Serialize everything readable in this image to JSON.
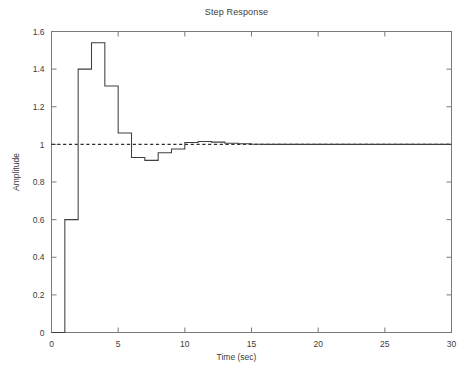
{
  "chart_data": {
    "type": "line",
    "title": "Step Response",
    "xlabel": "Time (sec)",
    "ylabel": "Amplitude",
    "xlim": [
      0,
      30
    ],
    "ylim": [
      0,
      1.6
    ],
    "xticks": [
      0,
      5,
      10,
      15,
      20,
      25,
      30
    ],
    "yticks": [
      0,
      0.2,
      0.4,
      0.6,
      0.8,
      1,
      1.2,
      1.4,
      1.6
    ],
    "xtick_labels": [
      "0",
      "5",
      "10",
      "15",
      "20",
      "25",
      "30"
    ],
    "ytick_labels": [
      "0",
      "0.2",
      "0.4",
      "0.6",
      "0.8",
      "1",
      "1.2",
      "1.4",
      "1.6"
    ],
    "grid": false,
    "legend": "none",
    "drawstyle": "steps-post",
    "series": [
      {
        "name": "step-response",
        "style": "solid",
        "color": "#3f3f3f",
        "x": [
          0,
          1,
          2,
          3,
          4,
          5,
          6,
          7,
          8,
          9,
          10,
          11,
          12,
          13,
          14,
          15,
          16,
          17,
          18,
          19,
          20,
          21,
          22,
          23,
          24,
          25,
          26,
          27,
          28,
          29,
          30
        ],
        "values": [
          0,
          0.6,
          1.4,
          1.54,
          1.31,
          1.06,
          0.93,
          0.915,
          0.955,
          0.975,
          1.01,
          1.015,
          1.012,
          1.006,
          1.003,
          1.001,
          1.0,
          1.0,
          1.0,
          1.0,
          1.0,
          1.0,
          1.0,
          1.0,
          1.0,
          1.0,
          1.0,
          1.0,
          1.0,
          1.0,
          1.0
        ]
      },
      {
        "name": "steady-state-reference",
        "style": "dashed",
        "color": "#2e2e2e",
        "x": [
          0,
          30
        ],
        "values": [
          1,
          1
        ]
      }
    ],
    "annotations": {
      "peak_value": 1.54,
      "peak_time": 3,
      "first_step_value": 0.6,
      "first_step_time": 1,
      "undershoot_value": 0.915,
      "undershoot_time": 7,
      "steady_state": 1
    }
  },
  "axes": {
    "background": "#ffffff",
    "frame_color": "#777777",
    "tick_color": "#777777"
  }
}
